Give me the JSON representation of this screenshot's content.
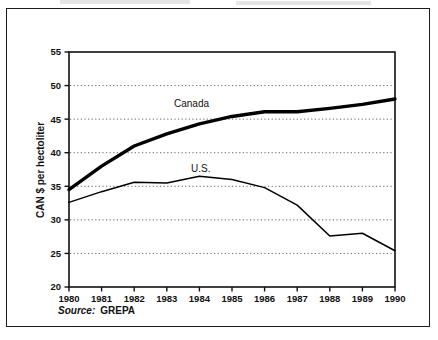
{
  "figure": {
    "source_label": "Source:",
    "source_value": "GREPA"
  },
  "chart_data": {
    "type": "line",
    "title": "",
    "xlabel": "",
    "ylabel": "CAN $ per hectoliter",
    "xlim": [
      1980,
      1990
    ],
    "ylim": [
      20,
      55
    ],
    "y_ticks": [
      20,
      25,
      30,
      35,
      40,
      45,
      50,
      55
    ],
    "y_tick_labels": [
      "20",
      "25",
      "30",
      "35",
      "40",
      "45",
      "50",
      "55"
    ],
    "grid": "horizontal-dotted",
    "gridlines_at": [
      25,
      30,
      35,
      40,
      45,
      50
    ],
    "legend": "inline-annotations",
    "x": [
      1980,
      1981,
      1982,
      1983,
      1984,
      1985,
      1986,
      1987,
      1988,
      1989,
      1990
    ],
    "x_tick_labels": [
      "1980",
      "1981",
      "1982",
      "1983",
      "1984",
      "1985",
      "1986",
      "1987",
      "1988",
      "1989",
      "1990"
    ],
    "series": [
      {
        "name": "Canada",
        "label_text": "Canada",
        "line_weight": "thick",
        "color": "#000000",
        "values": [
          34.5,
          38.0,
          41.0,
          42.8,
          44.3,
          45.4,
          46.1,
          46.1,
          46.6,
          47.2,
          48.0
        ]
      },
      {
        "name": "U.S.",
        "label_text": "U.S.",
        "line_weight": "thin",
        "color": "#000000",
        "values": [
          32.6,
          34.2,
          35.6,
          35.5,
          36.5,
          36.0,
          34.8,
          32.2,
          27.6,
          28.0,
          25.4
        ]
      }
    ]
  }
}
